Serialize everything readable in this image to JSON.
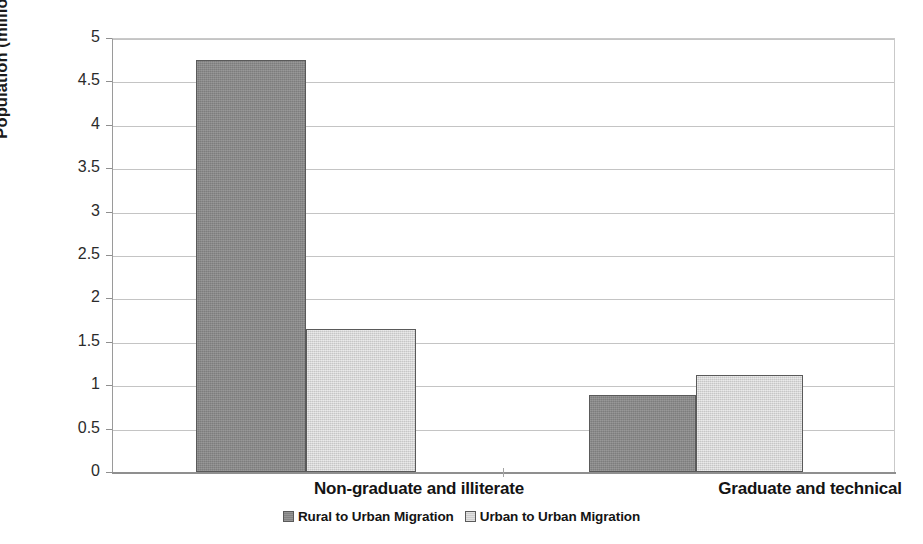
{
  "chart_data": {
    "type": "bar",
    "title": "",
    "subtitle": "",
    "xlabel": "",
    "ylabel": "Population (millions)",
    "categories": [
      "Non-graduate and illiterate",
      "Graduate and technical"
    ],
    "series": [
      {
        "name": "Rural to Urban Migration",
        "values": [
          4.75,
          0.89
        ],
        "color": "#8a8a8a"
      },
      {
        "name": "Urban to Urban Migration",
        "values": [
          1.65,
          1.12
        ],
        "color": "#d4d4d4"
      }
    ],
    "ylim": [
      0,
      5
    ],
    "ytick_step": 0.5,
    "ytick_labels": [
      "0",
      "0.5",
      "1",
      "1.5",
      "2",
      "2.5",
      "3",
      "3.5",
      "4",
      "4.5",
      "5"
    ],
    "grid": true,
    "grid_axis": "y",
    "legend_position": "bottom-center",
    "bar_border_color": "#5a5a5a",
    "gridline_color": "#c4c4c4",
    "axis_color": "#8f8f8f",
    "background": "#ffffff"
  }
}
